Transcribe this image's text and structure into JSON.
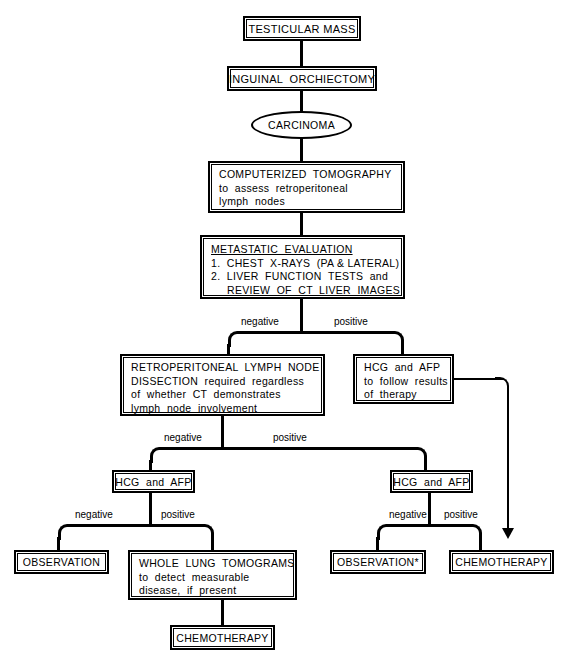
{
  "diagram": {
    "type": "flowchart",
    "line_color": "#000000",
    "background_color": "#ffffff"
  },
  "nodes": {
    "testicular_mass": {
      "label": "TESTICULAR MASS"
    },
    "inguinal_orchiectomy": {
      "label": "INGUINAL  ORCHIECTOMY"
    },
    "carcinoma": {
      "label": "CARCINOMA"
    },
    "ct": {
      "line1": "COMPUTERIZED  TOMOGRAPHY",
      "line2": "to  assess  retroperitoneal",
      "line3": "lymph  nodes"
    },
    "metastatic_eval": {
      "heading": "METASTATIC  EVALUATION",
      "item1": "1.  CHEST  X-RAYS  (PA & LATERAL)",
      "item2": "2.  LIVER  FUNCTION  TESTS  and",
      "item2b": "REVIEW  OF  CT  LIVER  IMAGES"
    },
    "rplnd": {
      "line1": "RETROPERITONEAL  LYMPH  NODE",
      "line2": "DISSECTION  required  regardless",
      "line3": "of  whether  CT  demonstrates",
      "line4": "lymph  node  involvement"
    },
    "hcg_afp_follow": {
      "line1": "HCG  and  AFP",
      "line2": "to  follow  results",
      "line3": "of  therapy"
    },
    "hcg_afp_left": {
      "label": "HCG  and  AFP"
    },
    "hcg_afp_right": {
      "label": "HCG  and  AFP"
    },
    "observation_left": {
      "label": "OBSERVATION"
    },
    "whole_lung": {
      "line1": "WHOLE  LUNG  TOMOGRAMS",
      "line2": "to  detect  measurable",
      "line3": "disease,  if  present"
    },
    "chemotherapy_bottom": {
      "label": "CHEMOTHERAPY"
    },
    "observation_right": {
      "label": "OBSERVATION*"
    },
    "chemotherapy_right": {
      "label": "CHEMOTHERAPY"
    }
  },
  "branch_labels": {
    "met_negative": "negative",
    "met_positive": "positive",
    "rplnd_negative": "negative",
    "rplnd_positive": "positive",
    "left_hcg_negative": "negative",
    "left_hcg_positive": "positive",
    "right_hcg_negative": "negative",
    "right_hcg_positive": "positive"
  }
}
